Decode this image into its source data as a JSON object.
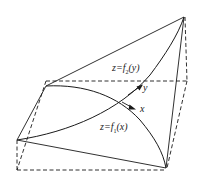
{
  "figure": {
    "type": "3d-surface-intersection-diagram",
    "labels": {
      "surface_y": {
        "prefix": "z=f",
        "subscript": "2",
        "suffix": "(y)"
      },
      "surface_x": {
        "prefix": "z=f",
        "subscript": "1",
        "suffix": "(x)"
      },
      "axis_y": "y",
      "axis_x": "x"
    },
    "colors": {
      "line": "#1a1a1a",
      "background": "#ffffff"
    }
  }
}
